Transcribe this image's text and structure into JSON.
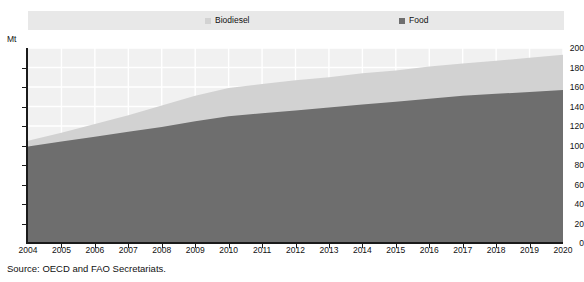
{
  "legend": {
    "entries": [
      {
        "label": "Biodiesel",
        "color": "#d2d2d2",
        "key": "biodiesel"
      },
      {
        "label": "Food",
        "color": "#6e6e6e",
        "key": "food"
      }
    ]
  },
  "axes": {
    "y_unit": "Mt",
    "y_ticks": [
      "0",
      "20",
      "40",
      "60",
      "80",
      "100",
      "120",
      "140",
      "160",
      "180",
      "200"
    ],
    "x_ticks": [
      "2004",
      "2005",
      "2006",
      "2007",
      "2008",
      "2009",
      "2010",
      "2011",
      "2012",
      "2013",
      "2014",
      "2015",
      "2016",
      "2017",
      "2018",
      "2019",
      "2020"
    ]
  },
  "source": {
    "text": "Source:  OECD and FAO Secretariats."
  },
  "chart_data": {
    "type": "area",
    "stacked": true,
    "title": "",
    "subtitle": "",
    "xlabel": "",
    "ylabel": "Mt",
    "ylim": [
      0,
      200
    ],
    "ytick_step": 20,
    "grid": true,
    "grid_color": "#ffffff",
    "legend_position": "top",
    "plot_background": "#f1f1f1",
    "categories": [
      "2004",
      "2005",
      "2006",
      "2007",
      "2008",
      "2009",
      "2010",
      "2011",
      "2012",
      "2013",
      "2014",
      "2015",
      "2016",
      "2017",
      "2018",
      "2019",
      "2020"
    ],
    "series": [
      {
        "name": "Food",
        "color": "#6e6e6e",
        "values": [
          99,
          104,
          109,
          114,
          119,
          125,
          130,
          133,
          136,
          139,
          142,
          145,
          148,
          151,
          153,
          155,
          157
        ]
      },
      {
        "name": "Biodiesel",
        "color": "#d2d2d2",
        "values": [
          6,
          9,
          13,
          17,
          22,
          26,
          29,
          30,
          31,
          31,
          32,
          32,
          33,
          33,
          34,
          35,
          36
        ]
      }
    ],
    "totals": [
      105,
      113,
      122,
      131,
      141,
      151,
      159,
      163,
      167,
      170,
      174,
      177,
      181,
      184,
      187,
      190,
      193
    ]
  }
}
